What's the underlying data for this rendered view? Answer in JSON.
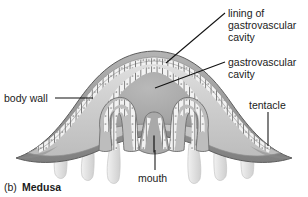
{
  "figure": {
    "caption_letter": "(b)",
    "caption_title": "Medusa",
    "background_color": "#ffffff",
    "ink_color": "#1b1b1b",
    "palette": {
      "mesoglea_light": "#d9d9d9",
      "epidermis_gray": "#9a9a9a",
      "epidermis_dark": "#7c7c7c",
      "gastrodermis_cells": "#efefef",
      "cavity_gray": "#a8a8a8",
      "cavity_shadow": "#8d8d8d",
      "tentacle_pale": "#e6e6e6",
      "outline": "#5d5d5d"
    }
  },
  "labels": [
    {
      "id": "lining-of-gastrovascular-cavity",
      "lines": [
        "lining of",
        "gastrovascular",
        "cavity"
      ],
      "text_x": 228,
      "text_y": 7,
      "line_height": 12,
      "leader": {
        "x1": 225,
        "y1": 13,
        "x2": 166,
        "y2": 63
      }
    },
    {
      "id": "gastrovascular-cavity",
      "lines": [
        "gastrovascular",
        "cavity"
      ],
      "text_x": 228,
      "text_y": 56,
      "line_height": 12,
      "leader": {
        "x1": 225,
        "y1": 62,
        "x2": 155,
        "y2": 88
      }
    },
    {
      "id": "body-wall",
      "lines": [
        "body wall"
      ],
      "text_x": 4,
      "text_y": 92,
      "line_height": 12,
      "leader": {
        "x1": 55,
        "y1": 98,
        "x2": 93,
        "y2": 98
      }
    },
    {
      "id": "tentacle",
      "lines": [
        "tentacle"
      ],
      "text_x": 249,
      "text_y": 99,
      "line_height": 12,
      "leader": {
        "x1": 268,
        "y1": 112,
        "x2": 268,
        "y2": 146
      }
    },
    {
      "id": "mouth",
      "lines": [
        "mouth"
      ],
      "text_x": 138,
      "text_y": 172,
      "line_height": 12,
      "leader": {
        "x1": 155,
        "y1": 150,
        "x2": 155,
        "y2": 170
      }
    }
  ],
  "caption": {
    "letter_x": 4,
    "letter_y": 183,
    "title_x": 22,
    "title_y": 183
  }
}
